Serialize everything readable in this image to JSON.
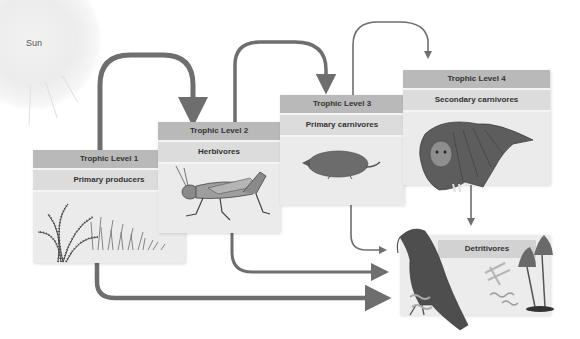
{
  "sun": {
    "label": "Sun"
  },
  "levels": [
    {
      "header": "Trophic Level 1",
      "title": "Primary producers",
      "image": "fern-and-grass-icon"
    },
    {
      "header": "Trophic Level 2",
      "title": "Herbivores",
      "image": "grasshopper-icon"
    },
    {
      "header": "Trophic Level 3",
      "title": "Primary carnivores",
      "image": "shrew-icon"
    },
    {
      "header": "Trophic Level 4",
      "title": "Secondary carnivores",
      "image": "owl-icon"
    }
  ],
  "detritivores": {
    "title": "Detritivores",
    "image": "vulture-worms-mushrooms-icon"
  },
  "colors": {
    "arrow": "#6e6e6e",
    "header": "#b9b9b9",
    "subheader": "#dcdcdc",
    "panel": "#ebebeb"
  }
}
